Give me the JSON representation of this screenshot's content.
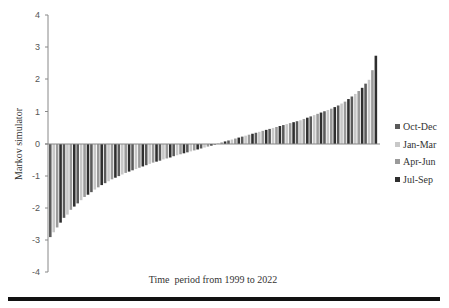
{
  "chart_data": {
    "type": "bar",
    "title": "",
    "xlabel": "Time  period from 1999 to 2022",
    "ylabel": "Markov simulator",
    "ylim": [
      -4,
      4
    ],
    "yticks": [
      4,
      3,
      2,
      1,
      0,
      -1,
      -2,
      -3,
      -4
    ],
    "grid": false,
    "legend_position": "right",
    "legend": [
      {
        "label": "Oct-Dec",
        "color": "#5a5a5a"
      },
      {
        "label": "Jan-Mar",
        "color": "#c8c8c8"
      },
      {
        "label": "Apr-Jun",
        "color": "#9a9a9a"
      },
      {
        "label": "Jul-Sep",
        "color": "#2e2e2e"
      }
    ],
    "series_note": "Sorted quarterly values (ascending), approx. 96 quarters",
    "values": [
      -2.9,
      -2.75,
      -2.6,
      -2.45,
      -2.3,
      -2.2,
      -2.05,
      -1.95,
      -1.85,
      -1.75,
      -1.65,
      -1.58,
      -1.5,
      -1.42,
      -1.35,
      -1.28,
      -1.22,
      -1.16,
      -1.1,
      -1.05,
      -1.0,
      -0.95,
      -0.9,
      -0.86,
      -0.82,
      -0.78,
      -0.74,
      -0.7,
      -0.66,
      -0.62,
      -0.58,
      -0.55,
      -0.52,
      -0.48,
      -0.45,
      -0.42,
      -0.38,
      -0.35,
      -0.32,
      -0.29,
      -0.26,
      -0.23,
      -0.2,
      -0.17,
      -0.14,
      -0.11,
      -0.08,
      -0.05,
      -0.02,
      0.02,
      0.05,
      0.08,
      0.11,
      0.14,
      0.17,
      0.2,
      0.23,
      0.26,
      0.29,
      0.32,
      0.35,
      0.38,
      0.41,
      0.44,
      0.47,
      0.5,
      0.53,
      0.56,
      0.59,
      0.62,
      0.65,
      0.68,
      0.71,
      0.74,
      0.78,
      0.82,
      0.86,
      0.9,
      0.94,
      0.98,
      1.02,
      1.06,
      1.1,
      1.15,
      1.2,
      1.26,
      1.32,
      1.4,
      1.48,
      1.56,
      1.65,
      1.75,
      1.88,
      2.0,
      2.3,
      2.75
    ]
  },
  "labels": {
    "xlabel": "Time  period from 1999 to 2022",
    "ylabel": "Markov simulator",
    "legend": [
      "Oct-Dec",
      "Jan-Mar",
      "Apr-Jun",
      "Jul-Sep"
    ],
    "yticks": [
      "4",
      "3",
      "2",
      "1",
      "0",
      "-1",
      "-2",
      "-3",
      "-4"
    ]
  }
}
